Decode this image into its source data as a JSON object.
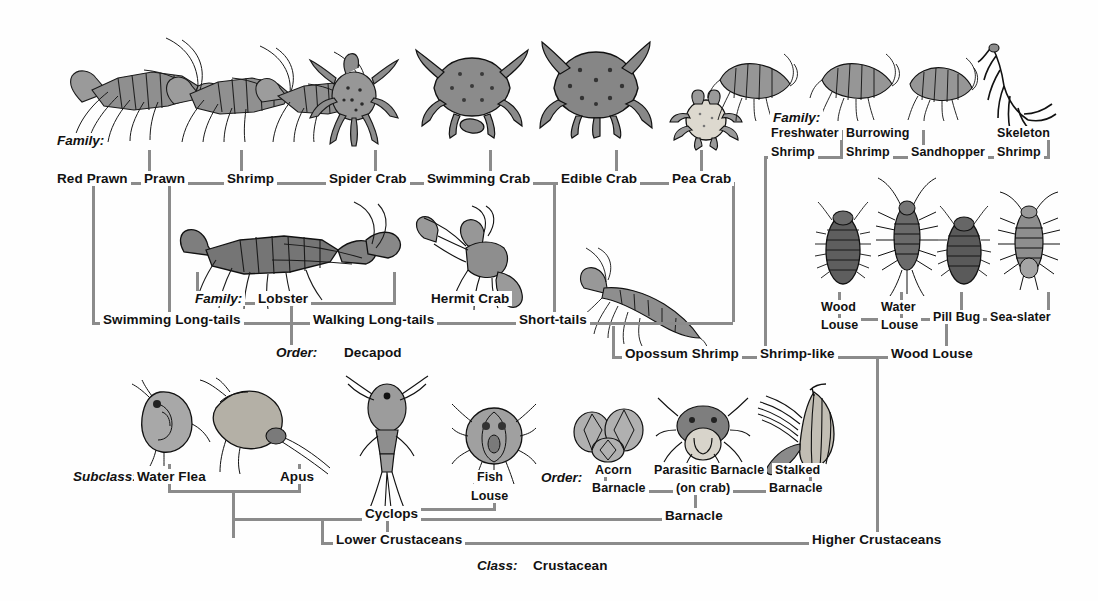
{
  "diagram": {
    "line_color": "#8b8b8b",
    "background": "#fefefe"
  },
  "ranks": {
    "family_left": "Family:",
    "family_right": "Family:",
    "family_decapod": "Family:",
    "order_decapod": "Order:",
    "order_barnacle": "Order:",
    "subclass": "Subclass:",
    "class": "Class:"
  },
  "rows": {
    "family_top": [
      {
        "label": "Red Prawn"
      },
      {
        "label": "Prawn"
      },
      {
        "label": "Shrimp"
      },
      {
        "label": "Spider Crab"
      },
      {
        "label": "Swimming Crab"
      },
      {
        "label": "Edible Crab"
      },
      {
        "label": "Pea Crab"
      }
    ],
    "family_peracarid": [
      {
        "label": "Freshwater",
        "label2": "Shrimp"
      },
      {
        "label": "Burrowing",
        "label2": "Shrimp"
      },
      {
        "label": "Sandhopper",
        "label2": ""
      },
      {
        "label": "Skeleton",
        "label2": "Shrimp"
      }
    ],
    "family_decapod_mid": [
      {
        "label": "Lobster"
      },
      {
        "label": "Hermit Crab"
      }
    ],
    "isopods": [
      {
        "label": "Wood",
        "label2": "Louse"
      },
      {
        "label": "Water",
        "label2": "Louse"
      },
      {
        "label": "Pill Bug",
        "label2": ""
      },
      {
        "label": "Sea-slater",
        "label2": ""
      }
    ],
    "suborders_decapod": [
      {
        "label": "Swimming Long-tails"
      },
      {
        "label": "Walking Long-tails"
      },
      {
        "label": "Short-tails"
      }
    ],
    "orders_upper": [
      {
        "label": "Decapod"
      },
      {
        "label": "Opossum Shrimp"
      },
      {
        "label": "Shrimp-like"
      },
      {
        "label": "Wood Louse"
      }
    ],
    "subclass_lower": [
      {
        "label": "Water Flea"
      },
      {
        "label": "Apus"
      },
      {
        "label": "Cyclops"
      },
      {
        "label": "Fish",
        "label2": "Louse"
      }
    ],
    "barnacles": [
      {
        "label": "Acorn",
        "label2": "Barnacle"
      },
      {
        "label": "Parasitic Barnacle",
        "label2": "(on crab)"
      },
      {
        "label": "Stalked",
        "label2": "Barnacle"
      }
    ],
    "order_barnacle_group": "Barnacle",
    "major_groups": [
      {
        "label": "Lower Crustaceans"
      },
      {
        "label": "Higher Crustaceans"
      }
    ],
    "class_name": "Crustacean"
  },
  "figures": [
    {
      "name": "red-prawn"
    },
    {
      "name": "prawn"
    },
    {
      "name": "shrimp"
    },
    {
      "name": "spider-crab"
    },
    {
      "name": "swimming-crab"
    },
    {
      "name": "edible-crab"
    },
    {
      "name": "pea-crab"
    },
    {
      "name": "freshwater-shrimp"
    },
    {
      "name": "burrowing-shrimp"
    },
    {
      "name": "sandhopper"
    },
    {
      "name": "skeleton-shrimp"
    },
    {
      "name": "lobster"
    },
    {
      "name": "hermit-crab"
    },
    {
      "name": "opossum-shrimp"
    },
    {
      "name": "wood-louse"
    },
    {
      "name": "water-louse"
    },
    {
      "name": "pill-bug"
    },
    {
      "name": "sea-slater"
    },
    {
      "name": "water-flea"
    },
    {
      "name": "apus"
    },
    {
      "name": "cyclops"
    },
    {
      "name": "fish-louse"
    },
    {
      "name": "acorn-barnacle"
    },
    {
      "name": "parasitic-barnacle"
    },
    {
      "name": "stalked-barnacle"
    }
  ]
}
